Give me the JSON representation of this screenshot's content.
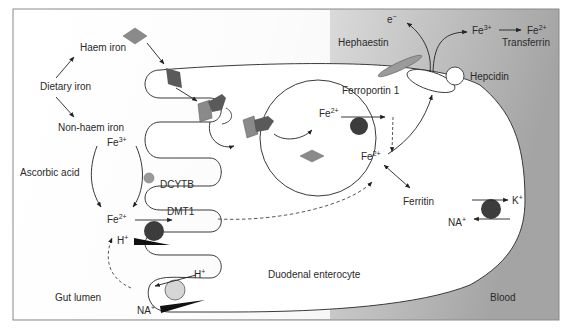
{
  "diagram": {
    "regions": {
      "lumen": "Gut lumen",
      "cell": "Duodenal enterocyte",
      "blood": "Blood"
    },
    "labels": {
      "dietary_iron": "Dietary iron",
      "haem_iron": "Haem iron",
      "non_haem_iron": "Non-haem iron",
      "ascorbic_acid": "Ascorbic acid",
      "hcp": "HCP",
      "dcytb": "DCYTB",
      "dmt1": "DMT1",
      "hephaestin": "Hephaestin",
      "ferroportin": "Ferroportin 1",
      "hepcidin": "Hepcidin",
      "ferritin": "Ferritin",
      "transferrin": "Transferrin",
      "electron": "e",
      "electron_sup": "−",
      "fe": "Fe",
      "fe3_sup": "3+",
      "fe2_sup": "2+",
      "h": "H",
      "na": "NA",
      "k": "K",
      "plus": "+"
    },
    "colors": {
      "outline": "#3a3a3a",
      "haem_diamond": "#8a8a8a",
      "hcp_dark": "#5a5a5a",
      "dmt1_ball": "#3c3c3c",
      "dcytb_ball": "#9a9a9a",
      "exchanger_ball": "#d6d6d6",
      "blood_grad_start": "#f2f2f2",
      "blood_grad_end": "#a8a8a8"
    }
  }
}
